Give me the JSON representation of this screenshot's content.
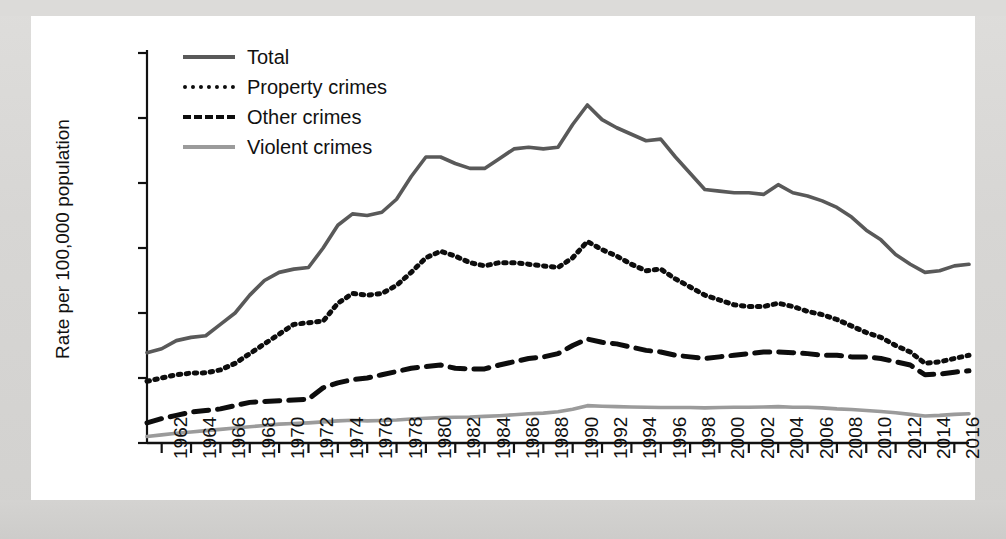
{
  "figure": {
    "background_color": "#d9d9d7",
    "panel_color": "#ffffff"
  },
  "axis": {
    "y_label": "Rate per 100,000 population",
    "y_ticks": [
      "12,000",
      "10,000",
      "8,000",
      "6,000",
      "4,000",
      "2,000",
      "0"
    ],
    "x_ticks": [
      "1962",
      "1964",
      "1966",
      "1968",
      "1970",
      "1972",
      "1974",
      "1976",
      "1978",
      "1980",
      "1982",
      "1984",
      "1986",
      "1988",
      "1990",
      "1992",
      "1994",
      "1996",
      "1998",
      "2000",
      "2002",
      "2004",
      "2006",
      "2008",
      "2010",
      "2012",
      "2014",
      "2016"
    ]
  },
  "legend": {
    "items": [
      {
        "label": "Total",
        "style": "solid",
        "color": "#595959",
        "key": "k-total"
      },
      {
        "label": "Property crimes",
        "style": "dotted",
        "color": "#0d0d0d",
        "key": "k-property"
      },
      {
        "label": "Other crimes",
        "style": "dashed",
        "color": "#0d0d0d",
        "key": "k-other"
      },
      {
        "label": "Violent crimes",
        "style": "solid",
        "color": "#9b9b9b",
        "key": "k-violent"
      }
    ]
  },
  "chart_data": {
    "type": "line",
    "title": "",
    "xlabel": "",
    "ylabel": "Rate per 100,000 population",
    "xlim": [
      1961,
      2017
    ],
    "ylim": [
      0,
      12000
    ],
    "ytick_values": [
      0,
      2000,
      4000,
      6000,
      8000,
      10000,
      12000
    ],
    "grid": false,
    "legend_position": "top-left",
    "x": [
      1961,
      1962,
      1963,
      1964,
      1965,
      1966,
      1967,
      1968,
      1969,
      1970,
      1971,
      1972,
      1973,
      1974,
      1975,
      1976,
      1977,
      1978,
      1979,
      1980,
      1981,
      1982,
      1983,
      1984,
      1985,
      1986,
      1987,
      1988,
      1989,
      1990,
      1991,
      1992,
      1993,
      1994,
      1995,
      1996,
      1997,
      1998,
      1999,
      2000,
      2001,
      2002,
      2003,
      2004,
      2005,
      2006,
      2007,
      2008,
      2009,
      2010,
      2011,
      2012,
      2013,
      2014,
      2015,
      2016,
      2017
    ],
    "series": [
      {
        "name": "Total",
        "style": "solid",
        "color": "#595959",
        "values": [
          2780,
          2900,
          3150,
          3250,
          3300,
          3650,
          4000,
          4550,
          5000,
          5250,
          5350,
          5400,
          6000,
          6700,
          7050,
          7000,
          7100,
          7500,
          8200,
          8800,
          8800,
          8600,
          8450,
          8450,
          8750,
          9050,
          9100,
          9050,
          9100,
          9800,
          10400,
          9950,
          9700,
          9500,
          9300,
          9350,
          8800,
          8300,
          7800,
          7750,
          7700,
          7700,
          7650,
          7950,
          7700,
          7600,
          7450,
          7250,
          6950,
          6550,
          6250,
          5800,
          5500,
          5250,
          5300,
          5450,
          5500
        ]
      },
      {
        "name": "Property crimes",
        "style": "dotted",
        "color": "#0d0d0d",
        "values": [
          1900,
          2000,
          2100,
          2150,
          2160,
          2250,
          2450,
          2750,
          3050,
          3350,
          3650,
          3700,
          3750,
          4300,
          4600,
          4550,
          4600,
          4850,
          5250,
          5700,
          5900,
          5750,
          5550,
          5450,
          5550,
          5550,
          5500,
          5450,
          5400,
          5700,
          6200,
          5950,
          5750,
          5500,
          5300,
          5350,
          5050,
          4800,
          4550,
          4400,
          4250,
          4200,
          4200,
          4300,
          4200,
          4050,
          3950,
          3800,
          3600,
          3400,
          3250,
          3000,
          2800,
          2450,
          2500,
          2600,
          2700
        ]
      },
      {
        "name": "Other crimes",
        "style": "dashed",
        "color": "#0d0d0d",
        "values": [
          620,
          750,
          850,
          950,
          1000,
          1050,
          1150,
          1250,
          1280,
          1300,
          1320,
          1350,
          1700,
          1850,
          1950,
          2000,
          2100,
          2200,
          2300,
          2350,
          2400,
          2300,
          2280,
          2280,
          2400,
          2500,
          2600,
          2650,
          2750,
          3000,
          3200,
          3100,
          3050,
          2950,
          2850,
          2800,
          2700,
          2650,
          2600,
          2650,
          2700,
          2750,
          2800,
          2800,
          2780,
          2750,
          2700,
          2700,
          2650,
          2650,
          2600,
          2500,
          2400,
          2100,
          2120,
          2180,
          2220
        ]
      },
      {
        "name": "Violent crimes",
        "style": "solid",
        "color": "#9b9b9b",
        "values": [
          200,
          250,
          300,
          340,
          380,
          420,
          460,
          500,
          540,
          580,
          600,
          620,
          650,
          680,
          700,
          680,
          690,
          710,
          740,
          760,
          780,
          790,
          800,
          820,
          840,
          870,
          900,
          920,
          960,
          1040,
          1150,
          1130,
          1120,
          1110,
          1100,
          1090,
          1090,
          1090,
          1080,
          1090,
          1100,
          1100,
          1110,
          1120,
          1100,
          1100,
          1080,
          1050,
          1030,
          1000,
          970,
          930,
          880,
          830,
          850,
          880,
          900
        ]
      }
    ]
  }
}
